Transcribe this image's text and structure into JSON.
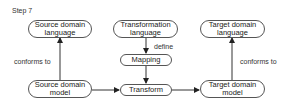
{
  "step_label": "Step 7",
  "nodes": {
    "source_language": "Source domain language",
    "transformation_language": "Transformation language",
    "target_language": "Target domain language",
    "mapping": "Mapping",
    "source_model": "Source domain model",
    "transform": "Transform",
    "target_model": "Target domain model"
  },
  "edges": {
    "source_conforms": "conforms to",
    "define": "define",
    "target_conforms": "conforms to"
  }
}
